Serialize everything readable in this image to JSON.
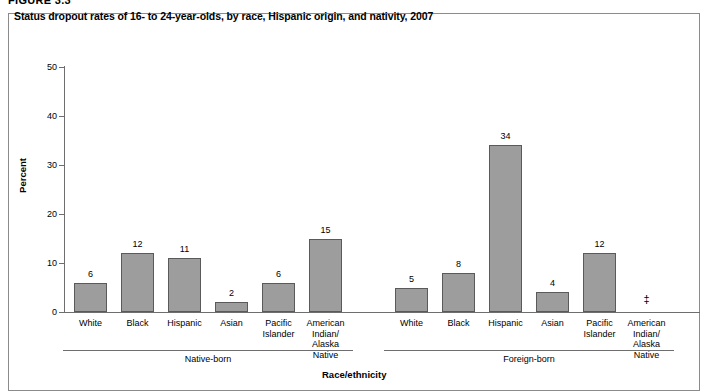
{
  "figure": {
    "number_label": "FIGURE 3.3"
  },
  "chart_data": {
    "type": "bar",
    "title": "Status dropout rates of 16- to 24-year-olds, by race, Hispanic origin, and nativity, 2007",
    "xlabel": "Race/ethnicity",
    "ylabel": "Percent",
    "ylim": [
      0,
      50
    ],
    "ytick_labels": [
      "0",
      "10",
      "20",
      "30",
      "40",
      "50"
    ],
    "ytick_values": [
      0,
      10,
      20,
      30,
      40,
      50
    ],
    "grid": false,
    "legend": "none",
    "categories": [
      "White",
      "Black",
      "Hispanic",
      "Asian",
      "Pacific\nIslander",
      "American\nIndian/\nAlaska Native"
    ],
    "groups": [
      {
        "name": "Native-born",
        "label": "Native-born",
        "bars": [
          {
            "category": "White",
            "label": "White",
            "value": 6,
            "value_label": "6",
            "suppressed": false
          },
          {
            "category": "Black",
            "label": "Black",
            "value": 12,
            "value_label": "12",
            "suppressed": false
          },
          {
            "category": "Hispanic",
            "label": "Hispanic",
            "value": 11,
            "value_label": "11",
            "suppressed": false
          },
          {
            "category": "Asian",
            "label": "Asian",
            "value": 2,
            "value_label": "2",
            "suppressed": false
          },
          {
            "category": "Pacific Islander",
            "label": "Pacific\nIslander",
            "value": 6,
            "value_label": "6",
            "suppressed": false
          },
          {
            "category": "American Indian/Alaska Native",
            "label": "American\nIndian/\nAlaska Native",
            "value": 15,
            "value_label": "15",
            "suppressed": false
          }
        ]
      },
      {
        "name": "Foreign-born",
        "label": "Foreign-born",
        "bars": [
          {
            "category": "White",
            "label": "White",
            "value": 5,
            "value_label": "5",
            "suppressed": false
          },
          {
            "category": "Black",
            "label": "Black",
            "value": 8,
            "value_label": "8",
            "suppressed": false
          },
          {
            "category": "Hispanic",
            "label": "Hispanic",
            "value": 34,
            "value_label": "34",
            "suppressed": false
          },
          {
            "category": "Asian",
            "label": "Asian",
            "value": 4,
            "value_label": "4",
            "suppressed": false
          },
          {
            "category": "Pacific Islander",
            "label": "Pacific\nIslander",
            "value": 12,
            "value_label": "12",
            "suppressed": false
          },
          {
            "category": "American Indian/Alaska Native",
            "label": "American\nIndian/\nAlaska Native",
            "value": null,
            "value_label": "‡",
            "suppressed": true
          }
        ]
      }
    ],
    "series": [
      {
        "name": "Native-born",
        "values": [
          6,
          12,
          11,
          2,
          6,
          15
        ]
      },
      {
        "name": "Foreign-born",
        "values": [
          5,
          8,
          34,
          4,
          12,
          null
        ]
      }
    ],
    "colors": {
      "bar_fill": "#9d9d9d",
      "bar_stroke": "#5a5a5a",
      "axis": "#6e6e6e",
      "panel_border": "#8b8b8b",
      "text": "#000000"
    }
  }
}
